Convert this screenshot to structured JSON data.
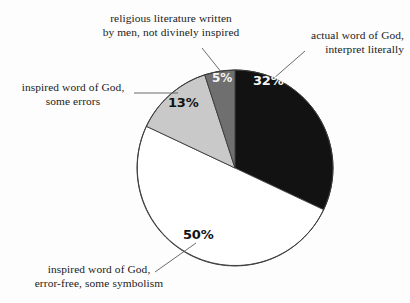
{
  "chart_data": {
    "type": "pie",
    "title": "",
    "subtitle": "",
    "xlabel": "",
    "ylabel": "",
    "legend_position": "callout-labels",
    "grid": false,
    "units": "percent",
    "total": 100,
    "start_angle_deg": 0,
    "direction": "clockwise",
    "categories": [
      "actual word of God, interpret literally",
      "inspired word of God, error-free, some symbolism",
      "inspired word of God, some errors",
      "religious literature written by men, not divinely inspired"
    ],
    "values": [
      32,
      50,
      13,
      5
    ],
    "value_labels": [
      "32%",
      "50%",
      "13%",
      "5%"
    ],
    "slice_colors": [
      "#121212",
      "#ffffff",
      "#c9c9c9",
      "#6f6f6f"
    ],
    "slices": [
      {
        "label": "actual word of God, interpret literally",
        "value": 32,
        "value_label": "32%",
        "color": "#121212",
        "label_color": "#f4f4f4"
      },
      {
        "label": "inspired word of God, error-free, some symbolism",
        "value": 50,
        "value_label": "50%",
        "color": "#ffffff",
        "label_color": "#121212"
      },
      {
        "label": "inspired word of God, some errors",
        "value": 13,
        "value_label": "13%",
        "color": "#c9c9c9",
        "label_color": "#121212"
      },
      {
        "label": "religious literature written by men, not divinely inspired",
        "value": 5,
        "value_label": "5%",
        "color": "#6f6f6f",
        "label_color": "#f4f4f4"
      }
    ]
  },
  "callouts": {
    "religious_literature": {
      "line1": "religious literature written",
      "line2": "by men, not divinely inspired"
    },
    "actual_word": {
      "line1": "actual word of God,",
      "line2": "interpret literally"
    },
    "inspired_some_errors": {
      "line1": "inspired word of God,",
      "line2": "some errors"
    },
    "inspired_error_free": {
      "line1": "inspired word of God,",
      "line2": "error-free, some symbolism"
    }
  },
  "percent_labels": {
    "black_slice": "32%",
    "white_slice": "50%",
    "light_gray_slice": "13%",
    "dark_gray_slice": "5%"
  },
  "style": {
    "background": "#fdfdfd",
    "outline_color": "#3a3a3a",
    "leader_color": "#5a5a5a"
  }
}
